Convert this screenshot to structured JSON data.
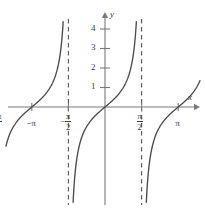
{
  "figure": {
    "name": "tangent-function-graph",
    "colors": {
      "curve": "#4a4a4a",
      "axis": "#7a7a7a",
      "asymptote": "#5a5a5a",
      "text": "#3a3a3a",
      "background": "#ffffff"
    }
  },
  "axes": {
    "x_axis_label": "x",
    "y_axis_label": "y",
    "origin_px": {
      "x": 105,
      "y": 107
    },
    "x_unit_px": 23.3,
    "y_unit_px": 19.5,
    "x_axis_pixel_range": [
      8,
      200
    ],
    "y_axis_pixel_range": [
      12,
      205
    ]
  },
  "chart_data": {
    "type": "line",
    "title": "",
    "subtitle": "",
    "xlabel": "x",
    "ylabel": "y",
    "function": "y = tan(x)",
    "grid": false,
    "legend": null,
    "xlim": [
      -5.2,
      4.3
    ],
    "ylim": [
      -5.0,
      5.0
    ],
    "x_ticks": [
      {
        "value": -4.71238898,
        "label_num": "3π",
        "label_den": "2",
        "sign": "−",
        "type": "fraction"
      },
      {
        "value": -3.141592653,
        "label": "−π",
        "type": "plain"
      },
      {
        "value": -1.570796326,
        "label_num": "π",
        "label_den": "2",
        "sign": "−",
        "type": "fraction"
      },
      {
        "value": 1.570796326,
        "label_num": "π",
        "label_den": "2",
        "sign": "",
        "type": "fraction"
      },
      {
        "value": 3.141592653,
        "label": "π",
        "type": "plain"
      },
      {
        "value": 4.71238898,
        "label_num": "3π",
        "label_den": "2",
        "sign": "",
        "type": "fraction"
      }
    ],
    "y_ticks": [
      {
        "value": 1,
        "label": "1"
      },
      {
        "value": 2,
        "label": "2"
      },
      {
        "value": 3,
        "label": "3"
      },
      {
        "value": 4,
        "label": "4"
      }
    ],
    "asymptotes": [
      {
        "x": -4.71238898,
        "label": "x = -3π/2",
        "style": "dashed"
      },
      {
        "x": -1.570796326,
        "label": "x = -π/2",
        "style": "dashed"
      },
      {
        "x": 1.570796326,
        "label": "x = π/2",
        "style": "dashed"
      },
      {
        "x": 4.71238898,
        "label": "x = 3π/2",
        "style": "dashed"
      }
    ],
    "branches": [
      {
        "name": "branch-left-partial",
        "center": -6.283185307,
        "x_from": -7.85,
        "x_to": -4.71238898
      },
      {
        "name": "branch-second",
        "center": -3.141592653,
        "x_from": -4.71238898,
        "x_to": -1.570796326
      },
      {
        "name": "branch-center",
        "center": 0.0,
        "x_from": -1.570796326,
        "x_to": 1.570796326
      },
      {
        "name": "branch-fourth",
        "center": 3.141592653,
        "x_from": 1.570796326,
        "x_to": 4.71238898
      }
    ],
    "notable_points": [
      {
        "x": -3.141592653,
        "y": 0,
        "note": "zero crossing at -pi"
      },
      {
        "x": 0,
        "y": 0,
        "note": "zero crossing at origin"
      },
      {
        "x": 3.141592653,
        "y": 0,
        "note": "zero crossing at pi"
      }
    ]
  }
}
